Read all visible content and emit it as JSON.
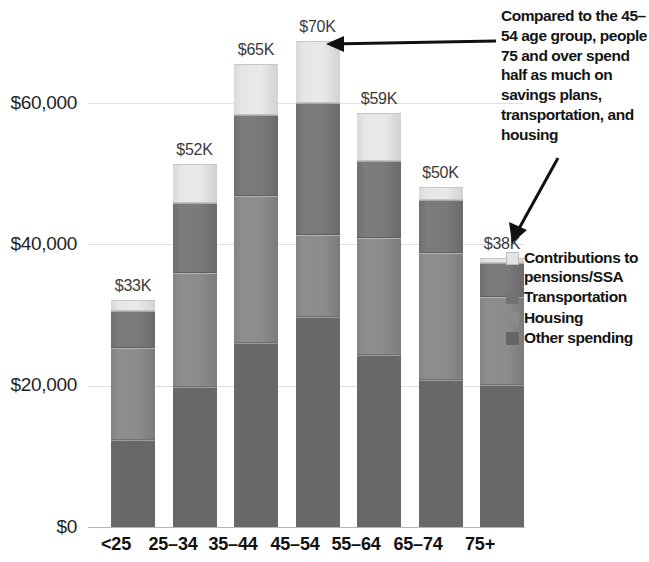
{
  "chart_data": {
    "type": "bar",
    "subtype": "stacked-bar",
    "title": "",
    "xlabel": "",
    "ylabel": "",
    "categories": [
      "<25",
      "25–34",
      "35–44",
      "45–54",
      "55–64",
      "65–74",
      "75+"
    ],
    "series": [
      {
        "name": "Contributions to pensions/SSA",
        "color": "#e6e6e6",
        "values": [
          1600,
          5400,
          7200,
          8800,
          6800,
          1800,
          800
        ]
      },
      {
        "name": "Transportation",
        "color": "#7a7a7a",
        "values": [
          5200,
          10000,
          11500,
          18700,
          10900,
          7500,
          4700
        ]
      },
      {
        "name": "Housing",
        "color": "#8a8a8a",
        "values": [
          13000,
          16100,
          20800,
          11600,
          16600,
          18000,
          12500
        ]
      },
      {
        "name": "Other spending",
        "color": "#666666",
        "values": [
          12300,
          19800,
          26000,
          29700,
          24300,
          20800,
          20100
        ]
      }
    ],
    "totals_labels": [
      "$33K",
      "$52K",
      "$65K",
      "$70K",
      "$59K",
      "$50K",
      "$38K"
    ],
    "totals": [
      33000,
      52000,
      65000,
      70000,
      59000,
      50000,
      38000
    ],
    "ylim": [
      0,
      72000
    ],
    "yticks": [
      0,
      20000,
      40000,
      60000
    ],
    "ytick_labels": [
      "$0",
      "$20,000",
      "$40,000",
      "$60,000"
    ],
    "grid": true,
    "legend_position": "right"
  },
  "axis": {
    "y_labels": [
      "$60,000",
      "$40,000",
      "$20,000",
      "$0"
    ],
    "x_labels": [
      "<25",
      "25–34",
      "35–44",
      "45–54",
      "55–64",
      "65–74",
      "75+"
    ]
  },
  "bars": [
    {
      "category": "<25",
      "total_label": "$33K",
      "segments": [
        {
          "key": "pension",
          "value": 1600
        },
        {
          "key": "transportation",
          "value": 5200
        },
        {
          "key": "housing",
          "value": 13000
        },
        {
          "key": "other",
          "value": 12300
        }
      ]
    },
    {
      "category": "25–34",
      "total_label": "$52K",
      "segments": [
        {
          "key": "pension",
          "value": 5400
        },
        {
          "key": "transportation",
          "value": 10000
        },
        {
          "key": "housing",
          "value": 16100
        },
        {
          "key": "other",
          "value": 19800
        }
      ]
    },
    {
      "category": "35–44",
      "total_label": "$65K",
      "segments": [
        {
          "key": "pension",
          "value": 7200
        },
        {
          "key": "transportation",
          "value": 11500
        },
        {
          "key": "housing",
          "value": 20800
        },
        {
          "key": "other",
          "value": 26000
        }
      ]
    },
    {
      "category": "45–54",
      "total_label": "$70K",
      "segments": [
        {
          "key": "pension",
          "value": 8800
        },
        {
          "key": "transportation",
          "value": 18700
        },
        {
          "key": "housing",
          "value": 11600
        },
        {
          "key": "other",
          "value": 29700
        }
      ]
    },
    {
      "category": "55–64",
      "total_label": "$59K",
      "segments": [
        {
          "key": "pension",
          "value": 6800
        },
        {
          "key": "transportation",
          "value": 10900
        },
        {
          "key": "housing",
          "value": 16600
        },
        {
          "key": "other",
          "value": 24300
        }
      ]
    },
    {
      "category": "65–74",
      "total_label": "$50K",
      "segments": [
        {
          "key": "pension",
          "value": 1800
        },
        {
          "key": "transportation",
          "value": 7500
        },
        {
          "key": "housing",
          "value": 18000
        },
        {
          "key": "other",
          "value": 20800
        }
      ]
    },
    {
      "category": "75+",
      "total_label": "$38K",
      "segments": [
        {
          "key": "pension",
          "value": 800
        },
        {
          "key": "transportation",
          "value": 4700
        },
        {
          "key": "housing",
          "value": 12500
        },
        {
          "key": "other",
          "value": 20100
        }
      ]
    }
  ],
  "legend": {
    "items": [
      {
        "key": "pension",
        "label": "Contributions to pensions/SSA",
        "color": "#e6e6e6"
      },
      {
        "key": "transportation",
        "label": "Transportation",
        "color": "#7a7a7a"
      },
      {
        "key": "housing",
        "label": "Housing",
        "color": "#8a8a8a"
      },
      {
        "key": "other",
        "label": "Other spending",
        "color": "#666666"
      }
    ]
  },
  "annotation": {
    "text": "Compared to the 45–54 age group, people 75 and over spend half as much on savings plans, transportation, and housing"
  },
  "colors": {
    "gridline": "#e2e0dd",
    "text": "#141414",
    "value_label": "#3a3a3a"
  }
}
